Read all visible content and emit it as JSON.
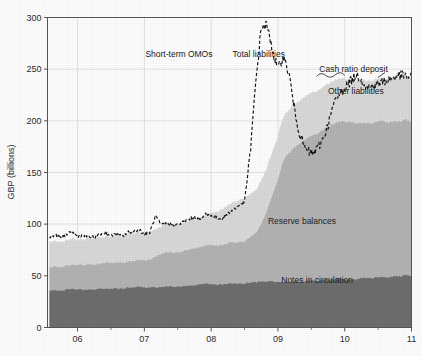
{
  "chart_data": {
    "type": "area",
    "title": "",
    "subtitle": "",
    "xlabel": "",
    "ylabel": "GBP (billions)",
    "ylim": [
      0,
      300
    ],
    "xlim": [
      2005.55,
      2011.0
    ],
    "grid": true,
    "legend_position": "inline-annotations",
    "y_ticks": [
      0,
      50,
      100,
      150,
      200,
      250,
      300
    ],
    "y_tick_labels": [
      "0",
      "50",
      "100",
      "150",
      "200",
      "250",
      "300"
    ],
    "x_ticks": [
      2006,
      2007,
      2008,
      2009,
      2010,
      2011
    ],
    "x_tick_labels": [
      "06",
      "07",
      "08",
      "09",
      "10",
      "11"
    ],
    "stacking_order": [
      "Notes in circulation",
      "Reserve balances",
      "Short-term OMOs",
      "Cash ratio deposit",
      "Other liabilities"
    ],
    "annotations": [
      {
        "label": "Short-term OMOs",
        "x": 2008.02,
        "y": 262,
        "anchor": "end"
      },
      {
        "label": "Total liabilities",
        "x": 2008.32,
        "y": 262,
        "anchor": "start"
      },
      {
        "label": "Cash ratio deposit",
        "x": 2009.62,
        "y": 247,
        "anchor": "start"
      },
      {
        "label": "Other liabilities",
        "x": 2009.75,
        "y": 226,
        "anchor": "start"
      },
      {
        "label": "Reserve balances",
        "x": 2008.85,
        "y": 100,
        "anchor": "start"
      },
      {
        "label": "Notes in circulation",
        "x": 2009.05,
        "y": 43,
        "anchor": "start"
      }
    ],
    "colors": {
      "notes_in_circulation": "#6e6e6e",
      "reserve_balances": "#b3b3b3",
      "other_liabilities": "#d9d9d9",
      "total_liabilities_line": "#141414",
      "axis": "#555555",
      "grid": "#dcdcdc",
      "background": "#fefefe"
    },
    "x": [
      2005.58,
      2005.67,
      2005.75,
      2005.83,
      2005.92,
      2006.0,
      2006.08,
      2006.17,
      2006.25,
      2006.33,
      2006.42,
      2006.5,
      2006.58,
      2006.67,
      2006.75,
      2006.83,
      2006.92,
      2007.0,
      2007.08,
      2007.17,
      2007.25,
      2007.33,
      2007.42,
      2007.5,
      2007.58,
      2007.67,
      2007.75,
      2007.83,
      2007.92,
      2008.0,
      2008.08,
      2008.17,
      2008.25,
      2008.33,
      2008.42,
      2008.5,
      2008.58,
      2008.67,
      2008.75,
      2008.83,
      2008.92,
      2009.0,
      2009.08,
      2009.17,
      2009.25,
      2009.33,
      2009.42,
      2009.5,
      2009.58,
      2009.67,
      2009.75,
      2009.83,
      2009.92,
      2010.0,
      2010.08,
      2010.17,
      2010.25,
      2010.33,
      2010.42,
      2010.5,
      2010.58,
      2010.67,
      2010.75,
      2010.83,
      2010.92,
      2011.0
    ],
    "series": [
      {
        "name": "Notes in circulation",
        "color": "#6e6e6e",
        "values": [
          36,
          36,
          36,
          37,
          38,
          37,
          37,
          37,
          37,
          38,
          38,
          38,
          38,
          38,
          39,
          39,
          40,
          39,
          39,
          39,
          39,
          40,
          40,
          40,
          40,
          41,
          41,
          42,
          43,
          42,
          42,
          42,
          43,
          43,
          43,
          43,
          44,
          44,
          45,
          45,
          45,
          44,
          44,
          44,
          45,
          45,
          45,
          46,
          46,
          46,
          47,
          47,
          48,
          47,
          47,
          47,
          48,
          48,
          48,
          49,
          49,
          49,
          50,
          50,
          51,
          50
        ]
      },
      {
        "name": "Reserve balances",
        "color": "#b3b3b3",
        "values": [
          23,
          23,
          23,
          23,
          24,
          24,
          24,
          24,
          24,
          24,
          25,
          25,
          25,
          25,
          25,
          26,
          26,
          26,
          27,
          30,
          32,
          33,
          33,
          33,
          34,
          35,
          36,
          36,
          37,
          38,
          38,
          38,
          39,
          40,
          40,
          41,
          44,
          48,
          56,
          68,
          84,
          100,
          118,
          126,
          130,
          134,
          138,
          140,
          142,
          145,
          148,
          150,
          152,
          152,
          152,
          151,
          150,
          150,
          150,
          151,
          151,
          150,
          150,
          150,
          150,
          150
        ]
      },
      {
        "name": "Other liabilities",
        "color": "#d9d9d9",
        "values": [
          24,
          24,
          24,
          24,
          25,
          24,
          24,
          25,
          25,
          25,
          25,
          25,
          25,
          25,
          26,
          26,
          27,
          26,
          26,
          26,
          26,
          27,
          27,
          27,
          27,
          28,
          28,
          28,
          29,
          30,
          32,
          34,
          36,
          38,
          40,
          41,
          41,
          41,
          41,
          41,
          41,
          41,
          41,
          41,
          41,
          41,
          41,
          41,
          41,
          41,
          41,
          41,
          41,
          41,
          41,
          41,
          41,
          41,
          41,
          41,
          41,
          41,
          41,
          41,
          41,
          41
        ]
      }
    ],
    "total_liabilities": {
      "name": "Total liabilities",
      "style": "dashed",
      "color": "#141414",
      "values": [
        88,
        89,
        87,
        90,
        92,
        88,
        89,
        88,
        87,
        90,
        92,
        89,
        90,
        88,
        92,
        93,
        95,
        90,
        92,
        108,
        99,
        101,
        100,
        99,
        102,
        105,
        107,
        104,
        110,
        108,
        106,
        105,
        110,
        114,
        118,
        122,
        165,
        238,
        290,
        293,
        268,
        250,
        262,
        244,
        210,
        186,
        172,
        168,
        172,
        182,
        196,
        215,
        226,
        232,
        238,
        244,
        240,
        232,
        234,
        236,
        238,
        240,
        242,
        244,
        243,
        242
      ]
    }
  }
}
